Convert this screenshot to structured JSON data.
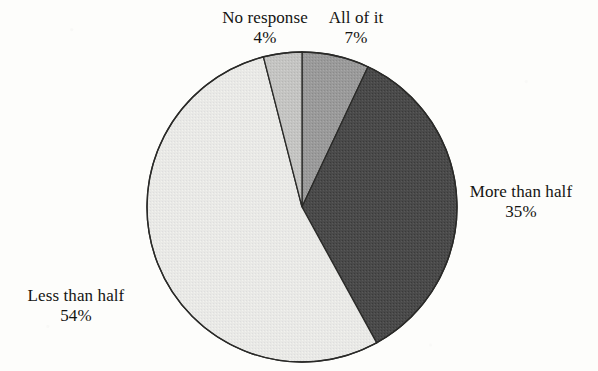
{
  "chart_data": {
    "type": "pie",
    "title": "",
    "subtitle": "",
    "xlabel": "",
    "ylabel": "",
    "legend_position": "none",
    "grid": false,
    "units": "percent",
    "total": 100,
    "start_angle_deg": 0,
    "direction": "clockwise",
    "categories": [
      "All of it",
      "More than half",
      "Less than half",
      "No response"
    ],
    "values": [
      7,
      35,
      54,
      4
    ],
    "slices": [
      {
        "name": "all-of-it",
        "label": "All of it",
        "percent_text": "7%",
        "value": 7,
        "color": "#9a9a9a",
        "start_deg": 0,
        "end_deg": 25.2,
        "label_position": "top-right"
      },
      {
        "name": "more-than-half",
        "label": "More than half",
        "percent_text": "35%",
        "value": 35,
        "color": "#4a4a4a",
        "start_deg": 25.2,
        "end_deg": 151.2,
        "label_position": "right"
      },
      {
        "name": "less-than-half",
        "label": "Less than half",
        "percent_text": "54%",
        "value": 54,
        "color": "#e8e8e5",
        "start_deg": 151.2,
        "end_deg": 345.6,
        "label_position": "bottom-left"
      },
      {
        "name": "no-response",
        "label": "No response",
        "percent_text": "4%",
        "value": 4,
        "color": "#c4c4c2",
        "start_deg": 345.6,
        "end_deg": 360,
        "label_position": "top-left"
      }
    ],
    "geometry": {
      "center_x": 302,
      "center_y": 207,
      "radius": 155,
      "outline_color": "#2a2a28",
      "outline_width": 1.3
    },
    "background_color": "#fdfdfb"
  }
}
